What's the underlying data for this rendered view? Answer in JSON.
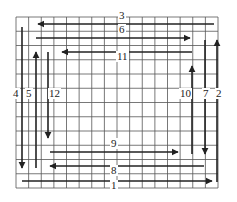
{
  "diagram": {
    "grid": {
      "x0": 16,
      "y0": 17,
      "x1": 218,
      "y1": 188,
      "cols": 16,
      "rows": 12,
      "color": "#555555"
    },
    "line_color": "#222222",
    "arrows": [
      {
        "id": "1",
        "label": "1",
        "orientation": "h",
        "from": [
          22,
          181
        ],
        "to": [
          212,
          181
        ],
        "head": "end",
        "label_pos": [
          113,
          185
        ]
      },
      {
        "id": "2",
        "label": "2",
        "orientation": "v",
        "from": [
          217,
          182
        ],
        "to": [
          217,
          40
        ],
        "head": "end",
        "label_pos": [
          218,
          93
        ]
      },
      {
        "id": "3",
        "label": "3",
        "orientation": "h",
        "from": [
          214,
          24
        ],
        "to": [
          38,
          24
        ],
        "head": "end",
        "label_pos": [
          121,
          15
        ]
      },
      {
        "id": "4",
        "label": "4",
        "orientation": "v",
        "from": [
          22,
          27
        ],
        "to": [
          22,
          168
        ],
        "head": "end",
        "label_pos": [
          15,
          93
        ]
      },
      {
        "id": "5",
        "label": "5",
        "orientation": "v",
        "from": [
          36,
          168
        ],
        "to": [
          36,
          52
        ],
        "head": "end",
        "label_pos": [
          28,
          93
        ]
      },
      {
        "id": "6",
        "label": "6",
        "orientation": "h",
        "from": [
          36,
          38
        ],
        "to": [
          190,
          38
        ],
        "head": "end",
        "label_pos": [
          121,
          29
        ]
      },
      {
        "id": "7",
        "label": "7",
        "orientation": "v",
        "from": [
          205,
          40
        ],
        "to": [
          205,
          154
        ],
        "head": "end",
        "label_pos": [
          205,
          93
        ]
      },
      {
        "id": "8",
        "label": "8",
        "orientation": "h",
        "from": [
          204,
          166
        ],
        "to": [
          50,
          166
        ],
        "head": "end",
        "label_pos": [
          113,
          170
        ]
      },
      {
        "id": "9",
        "label": "9",
        "orientation": "h",
        "from": [
          50,
          152
        ],
        "to": [
          178,
          152
        ],
        "head": "end",
        "label_pos": [
          113,
          143
        ]
      },
      {
        "id": "10",
        "label": "10",
        "orientation": "v",
        "from": [
          192,
          154
        ],
        "to": [
          192,
          66
        ],
        "head": "end",
        "label_pos": [
          182,
          93
        ]
      },
      {
        "id": "11",
        "label": "11",
        "orientation": "h",
        "from": [
          192,
          52
        ],
        "to": [
          62,
          52
        ],
        "head": "end",
        "label_pos": [
          119,
          56
        ]
      },
      {
        "id": "12",
        "label": "12",
        "orientation": "v",
        "from": [
          48,
          52
        ],
        "to": [
          48,
          138
        ],
        "head": "end",
        "label_pos": [
          51,
          93
        ]
      }
    ]
  }
}
